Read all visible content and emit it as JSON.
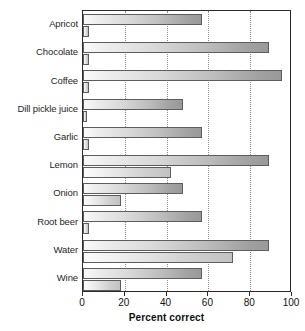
{
  "chart_data": {
    "type": "bar",
    "orientation": "horizontal",
    "title": "",
    "xlabel": "Percent correct",
    "ylabel": "",
    "xlim": [
      0,
      100
    ],
    "xticks": [
      0,
      20,
      40,
      60,
      80,
      100
    ],
    "grid": "vertical-dotted",
    "legend": "none",
    "categories": [
      "Apricot",
      "Chocolate",
      "Coffee",
      "Dill pickle juice",
      "Garlic",
      "Lemon",
      "Onion",
      "Root beer",
      "Water",
      "Wine"
    ],
    "series": [
      {
        "name": "series-1",
        "values": [
          57,
          89,
          95,
          48,
          57,
          89,
          48,
          57,
          89,
          57
        ]
      },
      {
        "name": "series-2",
        "values": [
          3,
          3,
          3,
          2,
          3,
          42,
          18,
          3,
          72,
          18
        ]
      }
    ]
  }
}
